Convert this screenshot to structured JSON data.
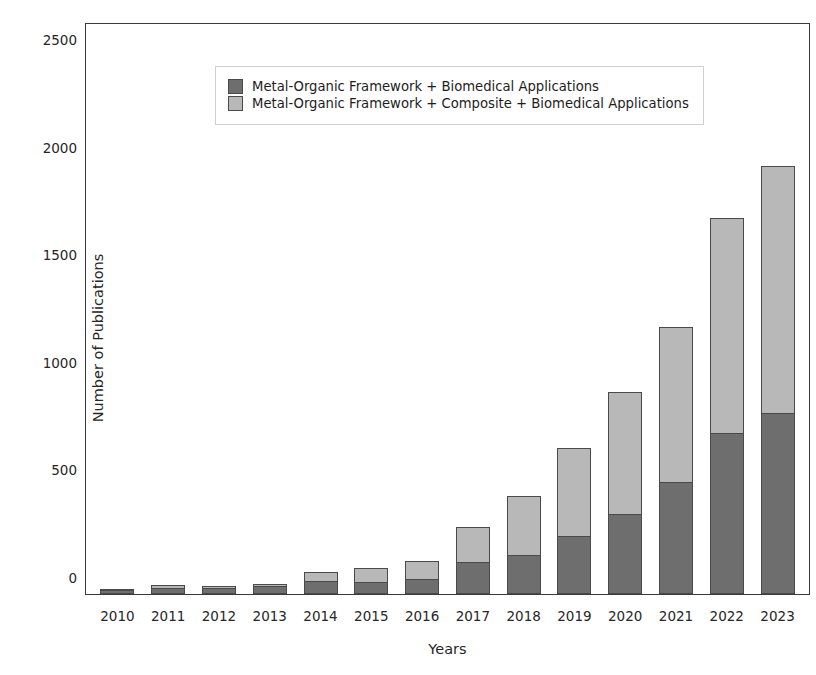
{
  "chart_data": {
    "type": "bar",
    "stacked": true,
    "title": "",
    "xlabel": "Years",
    "ylabel": "Number of Publications",
    "categories": [
      "2010",
      "2011",
      "2012",
      "2013",
      "2014",
      "2015",
      "2016",
      "2017",
      "2018",
      "2019",
      "2020",
      "2021",
      "2022",
      "2023"
    ],
    "ylim": [
      0,
      2650
    ],
    "yticks": [
      0,
      500,
      1000,
      1500,
      2000,
      2500
    ],
    "ytick_labels": [
      "0",
      "500",
      "1000",
      "1500",
      "2000",
      "2500"
    ],
    "grid": false,
    "legend_position": "upper left",
    "series": [
      {
        "name": "Metal-Organic Framework + Biomedical Applications",
        "color": "#6e6e6e",
        "values": [
          20,
          30,
          28,
          38,
          62,
          55,
          70,
          150,
          180,
          270,
          370,
          520,
          750,
          840
        ]
      },
      {
        "name": "Metal-Organic Framework + Composite + Biomedical Applications",
        "color": "#b8b8b8",
        "values": [
          5,
          12,
          8,
          10,
          40,
          65,
          85,
          160,
          275,
          410,
          570,
          720,
          1000,
          1150
        ]
      }
    ],
    "totals": [
      25,
      42,
      36,
      48,
      102,
      120,
      155,
      310,
      455,
      680,
      940,
      1240,
      1750,
      1990
    ]
  },
  "legend": {
    "items": [
      {
        "label": "Metal-Organic Framework + Biomedical Applications",
        "color": "#6e6e6e"
      },
      {
        "label": "Metal-Organic Framework + Composite + Biomedical Applications",
        "color": "#b8b8b8"
      }
    ]
  }
}
